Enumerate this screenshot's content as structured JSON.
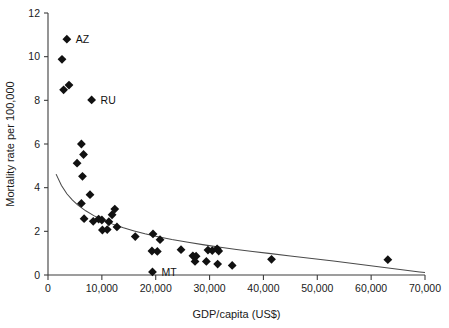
{
  "chart_data": {
    "type": "scatter",
    "title": "",
    "xlabel": "GDP/capita (US$)",
    "ylabel": "Mortality rate per 100,000",
    "xlim": [
      0,
      70000
    ],
    "ylim": [
      0,
      12
    ],
    "xticks": [
      0,
      10000,
      20000,
      30000,
      40000,
      50000,
      60000,
      70000
    ],
    "xtick_labels": [
      "0",
      "10,000",
      "20,000",
      "30,000",
      "40,000",
      "50,000",
      "60,000",
      "70,000"
    ],
    "yticks": [
      0,
      2,
      4,
      6,
      8,
      10,
      12
    ],
    "ytick_labels": [
      "0",
      "2",
      "4",
      "6",
      "8",
      "10",
      "12"
    ],
    "grid": false,
    "legend": false,
    "marker_style": "filled-diamond",
    "marker_color": "#111111",
    "trend_line": {
      "style": "solid",
      "color": "#4a4a4a",
      "description": "decaying power-law fit curve",
      "points": [
        [
          1500,
          4.62
        ],
        [
          2500,
          4.1
        ],
        [
          3500,
          3.72
        ],
        [
          4500,
          3.44
        ],
        [
          5500,
          3.21
        ],
        [
          7000,
          2.94
        ],
        [
          8500,
          2.72
        ],
        [
          10000,
          2.54
        ],
        [
          12000,
          2.33
        ],
        [
          14000,
          2.16
        ],
        [
          16000,
          2.02
        ],
        [
          18000,
          1.89
        ],
        [
          20000,
          1.78
        ],
        [
          23000,
          1.63
        ],
        [
          26000,
          1.5
        ],
        [
          29000,
          1.38
        ],
        [
          32000,
          1.27
        ],
        [
          35000,
          1.17
        ],
        [
          38000,
          1.08
        ],
        [
          41000,
          0.99
        ],
        [
          45000,
          0.87
        ],
        [
          49000,
          0.76
        ],
        [
          53000,
          0.64
        ],
        [
          57000,
          0.52
        ],
        [
          61000,
          0.39
        ],
        [
          65000,
          0.26
        ],
        [
          69000,
          0.14
        ],
        [
          70000,
          0.11
        ]
      ]
    },
    "points": [
      {
        "x": 2600,
        "y": 9.88,
        "label": ""
      },
      {
        "x": 3500,
        "y": 10.8,
        "label": "AZ"
      },
      {
        "x": 2900,
        "y": 8.48,
        "label": ""
      },
      {
        "x": 3900,
        "y": 8.7,
        "label": ""
      },
      {
        "x": 8100,
        "y": 8.02,
        "label": "RU"
      },
      {
        "x": 6200,
        "y": 6.0,
        "label": ""
      },
      {
        "x": 6600,
        "y": 5.52,
        "label": ""
      },
      {
        "x": 5400,
        "y": 5.12,
        "label": ""
      },
      {
        "x": 6400,
        "y": 4.52,
        "label": ""
      },
      {
        "x": 7800,
        "y": 3.68,
        "label": ""
      },
      {
        "x": 6200,
        "y": 3.28,
        "label": ""
      },
      {
        "x": 12400,
        "y": 3.02,
        "label": ""
      },
      {
        "x": 11900,
        "y": 2.76,
        "label": ""
      },
      {
        "x": 6700,
        "y": 2.58,
        "label": ""
      },
      {
        "x": 9400,
        "y": 2.56,
        "label": ""
      },
      {
        "x": 10000,
        "y": 2.52,
        "label": ""
      },
      {
        "x": 8400,
        "y": 2.46,
        "label": ""
      },
      {
        "x": 11300,
        "y": 2.44,
        "label": ""
      },
      {
        "x": 12800,
        "y": 2.2,
        "label": ""
      },
      {
        "x": 10100,
        "y": 2.06,
        "label": ""
      },
      {
        "x": 11000,
        "y": 2.08,
        "label": ""
      },
      {
        "x": 16200,
        "y": 1.76,
        "label": ""
      },
      {
        "x": 19500,
        "y": 1.88,
        "label": ""
      },
      {
        "x": 20800,
        "y": 1.62,
        "label": ""
      },
      {
        "x": 19300,
        "y": 1.1,
        "label": ""
      },
      {
        "x": 20300,
        "y": 1.08,
        "label": ""
      },
      {
        "x": 24700,
        "y": 1.16,
        "label": ""
      },
      {
        "x": 26900,
        "y": 0.88,
        "label": ""
      },
      {
        "x": 27500,
        "y": 0.86,
        "label": ""
      },
      {
        "x": 27300,
        "y": 0.62,
        "label": ""
      },
      {
        "x": 29400,
        "y": 0.62,
        "label": ""
      },
      {
        "x": 29700,
        "y": 1.14,
        "label": ""
      },
      {
        "x": 30500,
        "y": 1.12,
        "label": ""
      },
      {
        "x": 31400,
        "y": 1.2,
        "label": ""
      },
      {
        "x": 31700,
        "y": 1.1,
        "label": ""
      },
      {
        "x": 31500,
        "y": 0.5,
        "label": ""
      },
      {
        "x": 34200,
        "y": 0.44,
        "label": ""
      },
      {
        "x": 19400,
        "y": 0.14,
        "label": "MT"
      },
      {
        "x": 41500,
        "y": 0.72,
        "label": ""
      },
      {
        "x": 63100,
        "y": 0.7,
        "label": ""
      }
    ],
    "annotations": [
      {
        "text": "AZ",
        "x": 3500,
        "y": 10.8,
        "position": "right"
      },
      {
        "text": "RU",
        "x": 8100,
        "y": 8.02,
        "position": "right"
      },
      {
        "text": "MT",
        "x": 19400,
        "y": 0.14,
        "position": "right"
      }
    ]
  }
}
